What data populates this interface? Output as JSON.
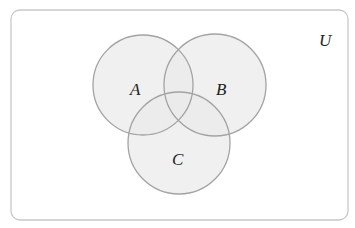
{
  "diagram": {
    "type": "venn",
    "universe": {
      "label": "U",
      "x": 11,
      "y": 10,
      "width": 337,
      "height": 210,
      "rx": 9,
      "stroke": "#c8c8c8",
      "fill": "#ffffff",
      "label_x": 319,
      "label_y": 46
    },
    "sets": [
      {
        "label": "A",
        "cx": 143,
        "cy": 85,
        "r": 50,
        "label_x": 130,
        "label_y": 95
      },
      {
        "label": "B",
        "cx": 215,
        "cy": 85,
        "r": 51,
        "label_x": 216,
        "label_y": 95
      },
      {
        "label": "C",
        "cx": 179,
        "cy": 143,
        "r": 51,
        "label_x": 172,
        "label_y": 165
      }
    ],
    "circle_fill": "#ebebeb",
    "circle_fill_opacity": 0.75,
    "circle_stroke": "#a3a3a3",
    "circle_stroke_width": 1.3
  }
}
